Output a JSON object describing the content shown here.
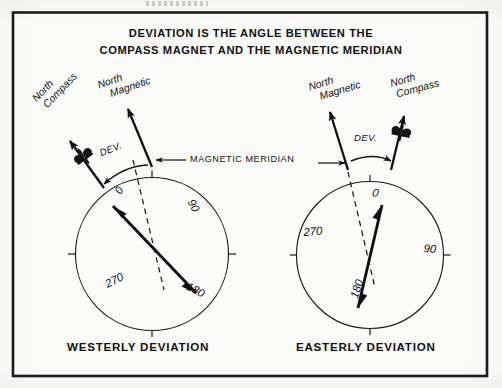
{
  "figure": {
    "title_line_1": "DEVIATION IS THE ANGLE BETWEEN THE",
    "title_line_2": "COMPASS MAGNET AND THE MAGNETIC MERIDIAN",
    "meridian_label": "MAGNETIC MERIDIAN",
    "border_color": "#1a1a1a",
    "ink_color": "#111111",
    "paper_color": "#fbfbfa"
  },
  "panels": [
    {
      "id": "westerly",
      "caption": "WESTERLY DEVIATION",
      "north_magnetic_label_line_1": "North",
      "north_magnetic_label_line_2": "Magnetic",
      "north_compass_label_line_1": "North",
      "north_compass_label_line_2": "Compass",
      "deviation_label": "DEV.",
      "compass_card_marks": [
        "0",
        "90",
        "180",
        "270"
      ],
      "needle_north_bearing_deg": 338,
      "needle_south_bearing_deg": 158,
      "north_magnetic_bearing_deg": 0,
      "north_compass_bearing_deg": 315,
      "deviation_direction": "west"
    },
    {
      "id": "easterly",
      "caption": "EASTERLY DEVIATION",
      "north_magnetic_label_line_1": "North",
      "north_magnetic_label_line_2": "Magnetic",
      "north_compass_label_line_1": "North",
      "north_compass_label_line_2": "Compass",
      "deviation_label": "DEV.",
      "compass_card_marks": [
        "0",
        "90",
        "180",
        "270"
      ],
      "needle_north_bearing_deg": 12,
      "needle_south_bearing_deg": 192,
      "north_magnetic_bearing_deg": 0,
      "north_compass_bearing_deg": 28,
      "deviation_direction": "east"
    }
  ]
}
